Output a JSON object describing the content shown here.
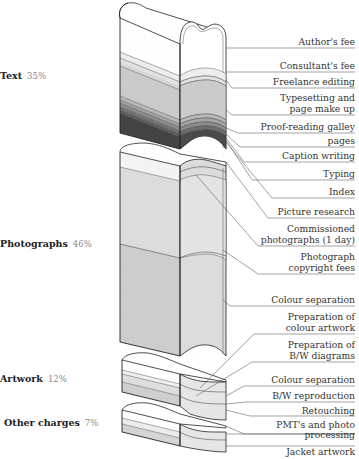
{
  "categories": [
    {
      "name": "Text",
      "pct": "35%"
    },
    {
      "name": "Photographs",
      "pct": "46%"
    },
    {
      "name": "Artwork",
      "pct": "12%"
    },
    {
      "name": "Other charges",
      "pct": "7%"
    }
  ],
  "labels": [
    {
      "text": "Author's fee"
    },
    {
      "text": "Consultant's fee"
    },
    {
      "text": "Freelance editing"
    },
    {
      "text": "Typesetting and\npage make up"
    },
    {
      "text": "Proof-reading galley"
    },
    {
      "text": "pages"
    },
    {
      "text": "Caption writing"
    },
    {
      "text": "Typing"
    },
    {
      "text": "Index"
    },
    {
      "text": "Picture research"
    },
    {
      "text": "Commissioned\nphotographs (1 day)"
    },
    {
      "text": "Photograph\ncopyright fees"
    },
    {
      "text": "Colour separation"
    },
    {
      "text": "Preparation of\ncolour artwork"
    },
    {
      "text": "Preparation of\nB/W diagrams"
    },
    {
      "text": "Colour separation"
    },
    {
      "text": "B/W reproduction"
    },
    {
      "text": "Retouching"
    },
    {
      "text": "PMT's and photo\nprocessing"
    },
    {
      "text": "Jacket artwork"
    }
  ]
}
